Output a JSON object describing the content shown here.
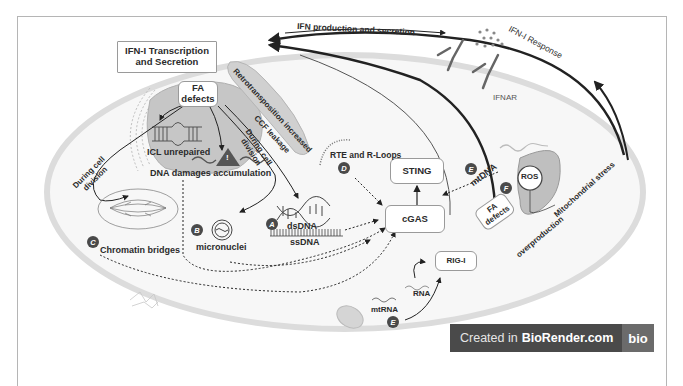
{
  "figure": {
    "title_box": "IFN-I Transcription and Secretion",
    "title_box_lines": [
      "IFN-I Transcription",
      "and Secretion"
    ],
    "labels": {
      "ifn_production": "IFN production and secretion",
      "ifn_response": "IFN-I Response",
      "ifnar": "IFNAR",
      "retrotransposition": "Retrotransposition increased",
      "ccf_leakage": "CCF leakage",
      "during_cell_division_left": "During cell division",
      "during_cell_division_left_lines": [
        "During cell",
        "division"
      ],
      "during_cell_division_mid_lines": [
        "During cell",
        "division"
      ],
      "icl_unrepaired": "ICL unrepaired",
      "dna_damages": "DNA damages accumulation",
      "rte_rloops": "RTE and R-Loops",
      "dsdna": "dsDNA",
      "ssdna": "ssDNA",
      "micronuclei": "micronuclei",
      "chromatin_bridges": "Chromatin bridges",
      "mtdna": "mtDNA",
      "mtrna": "mtRNA",
      "rna": "RNA",
      "mitochondrial_stress": "Mitochondrial stress",
      "overproduction": "overproduction",
      "warning_glyph": "!"
    },
    "nodes": {
      "fa_defects_nucleus_lines": [
        "FA",
        "defects"
      ],
      "fa_defects_mito_lines": [
        "FA",
        "defects"
      ],
      "sting": "STING",
      "cgas": "cGAS",
      "rig_i": "RIG-I",
      "ros": "ROS"
    },
    "badges": {
      "a": "A",
      "b": "B",
      "c": "C",
      "d": "D",
      "e_mtdna": "E",
      "e_mtrna": "E",
      "f": "F"
    }
  },
  "watermark": {
    "prefix": "Created in",
    "brand": "BioRender.com",
    "logo": "bio"
  },
  "colors": {
    "cell_membrane": "#d9d9d9",
    "nucleus_fill": "#c8c8c8",
    "text": "#2b2b2b",
    "badge": "#4a4a4a",
    "watermark_bg": "#4a4a4a",
    "watermark_logo_bg": "#6b6b6b"
  }
}
